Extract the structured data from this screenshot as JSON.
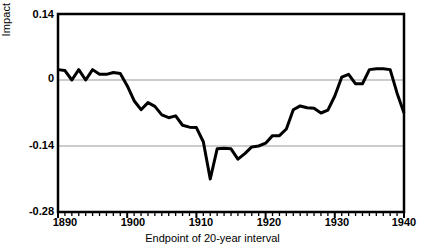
{
  "chart_data": {
    "type": "line",
    "title": "",
    "xlabel": "Endpoint of 20-year interval",
    "ylabel": "Impact at t - 3",
    "xlim": [
      1890,
      1940
    ],
    "ylim": [
      -0.28,
      0.14
    ],
    "xticks": [
      1890,
      1900,
      1910,
      1920,
      1930,
      1940
    ],
    "xtick_labels": [
      "1890",
      "1900",
      "1910",
      "1920",
      "1930",
      "1940"
    ],
    "yticks": [
      0.14,
      0,
      -0.14,
      -0.28
    ],
    "ytick_labels": [
      "0.14",
      "0",
      "-0.14",
      "-0.28"
    ],
    "minor_xtick_interval": 1,
    "grid": "horizontal gridlines at 0 and -0.14",
    "gridlines": [
      0,
      -0.14
    ],
    "line_color": "#000000",
    "line_width": 3,
    "grid_color": "#999999",
    "axis_color": "#000000",
    "legend": null,
    "x": [
      1890,
      1891,
      1892,
      1893,
      1894,
      1895,
      1896,
      1897,
      1898,
      1899,
      1900,
      1901,
      1902,
      1903,
      1904,
      1905,
      1906,
      1907,
      1908,
      1909,
      1910,
      1911,
      1912,
      1913,
      1914,
      1915,
      1916,
      1917,
      1918,
      1919,
      1920,
      1921,
      1922,
      1923,
      1924,
      1925,
      1926,
      1927,
      1928,
      1929,
      1930,
      1931,
      1932,
      1933,
      1934,
      1935,
      1936,
      1937,
      1938,
      1939,
      1940
    ],
    "values": [
      0.022,
      0.02,
      0.0,
      0.022,
      0.0,
      0.022,
      0.012,
      0.012,
      0.016,
      0.014,
      -0.012,
      -0.044,
      -0.063,
      -0.048,
      -0.056,
      -0.074,
      -0.08,
      -0.076,
      -0.096,
      -0.1,
      -0.101,
      -0.131,
      -0.21,
      -0.146,
      -0.145,
      -0.146,
      -0.168,
      -0.156,
      -0.142,
      -0.14,
      -0.134,
      -0.118,
      -0.118,
      -0.104,
      -0.063,
      -0.055,
      -0.059,
      -0.06,
      -0.07,
      -0.064,
      -0.034,
      0.006,
      0.012,
      -0.008,
      -0.008,
      0.022,
      0.024,
      0.024,
      0.022,
      -0.028,
      -0.07
    ]
  },
  "axes": {
    "y_top_label": "0.14",
    "y_zero_label": "0",
    "y_mid_label": "-0.14",
    "y_bottom_label": "-0.28",
    "x_start_label": "1890",
    "x_1900_label": "1900",
    "x_1910_label": "1910",
    "x_1920_label": "1920",
    "x_1930_label": "1930",
    "x_end_label": "1940",
    "x_axis_title": "Endpoint of 20-year interval",
    "y_axis_title": "Impact at t - 3"
  }
}
